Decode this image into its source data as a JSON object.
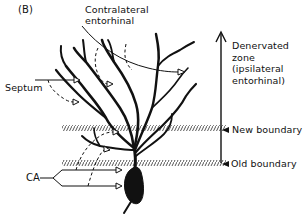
{
  "figure": {
    "panel_label": "(B)",
    "colors": {
      "ink": "#111111",
      "background": "#ffffff",
      "hatch": "#555555"
    }
  },
  "labels": {
    "contralateral": {
      "line1": "Contralateral",
      "line2": "entorhinal"
    },
    "septum": "Septum",
    "ca": "CA",
    "denervated_zone": {
      "line1": "Denervated",
      "line2": "zone",
      "line3": "(ipsilateral",
      "line4": "entorhinal)"
    },
    "new_boundary": "New boundary",
    "old_boundary": "Old boundary"
  },
  "elements": {
    "inputs": [
      "Contralateral entorhinal",
      "Septum",
      "CA"
    ],
    "boundaries": [
      "New boundary",
      "Old boundary"
    ],
    "zone_arrow": "up-arrow",
    "cell": "granule-cell-soma"
  }
}
